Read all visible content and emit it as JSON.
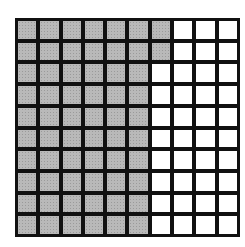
{
  "diagram": {
    "type": "hundred-grid",
    "rows": 10,
    "columns": 10,
    "total_cells": 100,
    "shaded_count": 62,
    "unshaded_count": 38,
    "shaded_color": "#b9b9b9",
    "unshaded_color": "#ffffff",
    "line_color": "#111111",
    "shaded_pattern": "columns 1-6 fully shaded in all 10 rows; column 7 shaded in rows 1-2"
  }
}
